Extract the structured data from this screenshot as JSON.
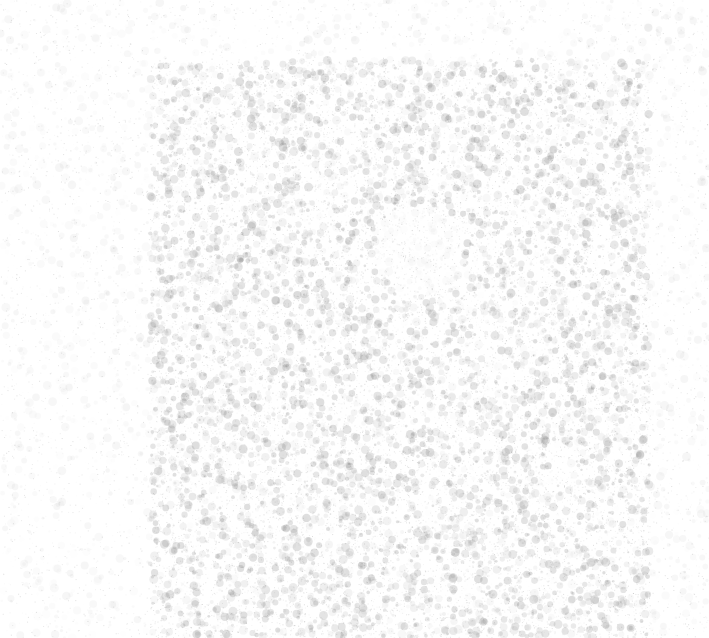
{
  "image": {
    "width": 709,
    "height": 638,
    "background_color": "#ffffff",
    "noise_color": "#9a9a9a",
    "description": "Mottled light-gray noise texture on white, denser in a central square region"
  },
  "texture": {
    "dense_region": {
      "x": 150,
      "y": 60,
      "width": 500,
      "height": 578
    },
    "seed": 1337,
    "dense_alpha_max": 0.28,
    "sparse_alpha_max": 0.08,
    "clearing": {
      "cx": 420,
      "cy": 250,
      "r": 45
    }
  }
}
